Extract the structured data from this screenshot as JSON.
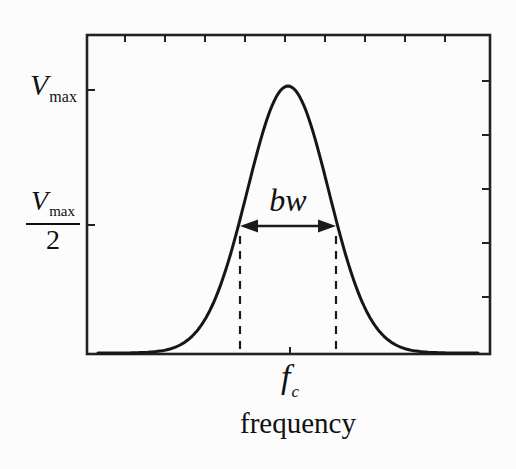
{
  "figure": {
    "type": "resonance-bandwidth-diagram",
    "background_color": "#fcfcfc",
    "line_color": "#1b1b1b",
    "text_color": "#111111"
  },
  "labels": {
    "v_max": {
      "symbol": "V",
      "subscript": "max"
    },
    "v_half": {
      "numerator_symbol": "V",
      "numerator_subscript": "max",
      "denominator": "2"
    },
    "bandwidth": "bw",
    "center_frequency": {
      "symbol": "f",
      "subscript": "c"
    },
    "x_axis_title": "frequency"
  },
  "chart_data": {
    "type": "line",
    "title": "",
    "xlabel": "frequency",
    "ylabel": "",
    "x_tick_labels": [
      "f_c"
    ],
    "y_tick_labels": [
      "V_max",
      "V_max / 2"
    ],
    "axis_style": {
      "frame": "full box",
      "ticks": "inward",
      "numeric_scale": false,
      "grid": false
    },
    "series": [
      {
        "name": "resonance response curve",
        "shape": "gaussian",
        "peak": {
          "x": "f_c",
          "y": "V_max"
        },
        "half_maximum_level": "V_max / 2",
        "full_width_at_half_maximum": "bw",
        "normalized_points": {
          "x_offset_in_bw_units": [
            -2,
            -1.75,
            -1.5,
            -1.25,
            -1,
            -0.75,
            -0.5,
            -0.25,
            0,
            0.25,
            0.5,
            0.75,
            1,
            1.25,
            1.5,
            1.75,
            2
          ],
          "v_over_vmax": [
            0,
            0.0002,
            0.002,
            0.0131,
            0.0625,
            0.2102,
            0.5,
            0.8409,
            1,
            0.8409,
            0.5,
            0.2102,
            0.0625,
            0.0131,
            0.002,
            0.0002,
            0
          ]
        }
      }
    ],
    "annotations": [
      {
        "type": "double_headed_arrow",
        "label": "bw",
        "y_level": "V_max / 2",
        "from_x": "f_c - bw/2",
        "to_x": "f_c + bw/2"
      },
      {
        "type": "dashed_vertical_line",
        "x": "f_c - bw/2"
      },
      {
        "type": "dashed_vertical_line",
        "x": "f_c + bw/2"
      }
    ]
  }
}
